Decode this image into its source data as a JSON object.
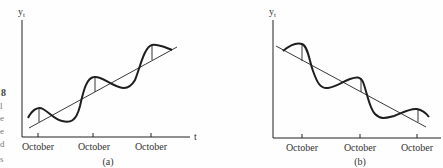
{
  "figure": {
    "side_text_fragments": [
      "8",
      "l",
      "e",
      "e",
      "d",
      "s"
    ],
    "panel_a": {
      "y_label": "y",
      "y_subscript": "t",
      "x_label": "t",
      "tick_labels": [
        "October",
        "October",
        "October"
      ],
      "caption": "(a)",
      "description": "Seasonal oscillation around an upward linear trend"
    },
    "panel_b": {
      "y_label": "y",
      "y_subscript": "t",
      "tick_labels": [
        "October",
        "October",
        "October"
      ],
      "caption": "(b)",
      "description": "Seasonal oscillation around a downward linear trend"
    }
  },
  "colors": {
    "ink": "#1e1e1e",
    "background": "#fefefe"
  }
}
